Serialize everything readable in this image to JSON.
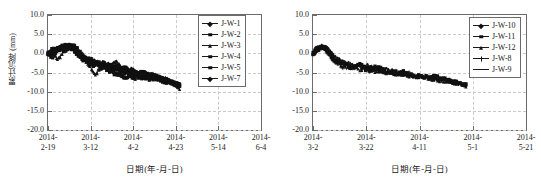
{
  "figure": {
    "panels": [
      {
        "id": "left-chart",
        "ylabel": "累计沉降 (mm)",
        "xlabel": "日期(年-月-日)",
        "yticks": [
          "10.0",
          "5.0",
          "0.0",
          "-5.0",
          "-10.0",
          "-15.0",
          "-20.0"
        ],
        "xticks": [
          {
            "top": "2014-",
            "bottom": "2-19"
          },
          {
            "top": "2014-",
            "bottom": "3-12"
          },
          {
            "top": "2014-",
            "bottom": "4-2"
          },
          {
            "top": "2014-",
            "bottom": "4-23"
          },
          {
            "top": "2014-",
            "bottom": "5-14"
          },
          {
            "top": "2014-",
            "bottom": "6-4"
          }
        ],
        "legend": [
          {
            "label": "J-W-1",
            "marker": "diamond"
          },
          {
            "label": "J-W-2",
            "marker": "square"
          },
          {
            "label": "J-W-3",
            "marker": "triangle"
          },
          {
            "label": "J-W-4",
            "marker": "square"
          },
          {
            "label": "J-W-5",
            "marker": "square"
          },
          {
            "label": "J-W-7",
            "marker": "diamond"
          }
        ]
      },
      {
        "id": "right-chart",
        "ylabel": "累计沉降 (mm)",
        "xlabel": "日期(年-月-日)",
        "yticks": [
          "10.0",
          "5.0",
          "0.0",
          "-5.0",
          "-10.0",
          "-15.0",
          "-20.0"
        ],
        "xticks": [
          {
            "top": "2014-",
            "bottom": "3-2"
          },
          {
            "top": "2014-",
            "bottom": "3-22"
          },
          {
            "top": "2014-",
            "bottom": "4-11"
          },
          {
            "top": "2014-",
            "bottom": "5-1"
          },
          {
            "top": "2014-",
            "bottom": "5-21"
          }
        ],
        "legend": [
          {
            "label": "J-W-10",
            "marker": "diamond"
          },
          {
            "label": "J-W-11",
            "marker": "square"
          },
          {
            "label": "J-W-12",
            "marker": "triangle"
          },
          {
            "label": "J-W-8",
            "marker": "plus"
          },
          {
            "label": "J-W-9",
            "marker": "none"
          }
        ]
      }
    ]
  },
  "chart_data": [
    {
      "type": "line",
      "id": "left-chart",
      "title": "",
      "xlabel": "日期(年-月-日)",
      "ylabel": "累计沉降 (mm)",
      "ylim": [
        -20.0,
        10.0
      ],
      "ytick_values": [
        10.0,
        5.0,
        0.0,
        -5.0,
        -10.0,
        -15.0,
        -20.0
      ],
      "xtick_labels": [
        "2014-2-19",
        "2014-3-12",
        "2014-4-2",
        "2014-4-23",
        "2014-5-14",
        "2014-6-4"
      ],
      "x_unit": "date",
      "grid": true,
      "legend_position": "top-right",
      "x_data_fraction_range": [
        0.0,
        0.62
      ],
      "series": [
        {
          "name": "J-W-1",
          "marker": "diamond",
          "x": [
            0.0,
            0.02,
            0.04,
            0.06,
            0.08,
            0.1,
            0.12,
            0.14,
            0.16,
            0.18,
            0.2,
            0.22,
            0.24,
            0.26,
            0.28,
            0.3,
            0.32,
            0.34,
            0.36,
            0.38,
            0.4,
            0.42,
            0.44,
            0.46,
            0.48,
            0.5,
            0.52,
            0.54,
            0.56,
            0.58,
            0.6,
            0.62
          ],
          "y": [
            0.0,
            0.6,
            1.4,
            1.0,
            1.9,
            2.2,
            1.6,
            0.4,
            -0.6,
            -1.2,
            -1.9,
            -2.1,
            -2.6,
            -2.2,
            -2.9,
            -3.4,
            -3.1,
            -3.8,
            -4.1,
            -4.4,
            -4.2,
            -4.8,
            -5.1,
            -5.0,
            -5.4,
            -5.8,
            -6.2,
            -6.5,
            -6.9,
            -7.4,
            -7.8,
            -8.2
          ]
        },
        {
          "name": "J-W-2",
          "marker": "square",
          "x": [
            0.0,
            0.02,
            0.04,
            0.06,
            0.08,
            0.1,
            0.12,
            0.14,
            0.16,
            0.18,
            0.2,
            0.22,
            0.24,
            0.26,
            0.28,
            0.3,
            0.32,
            0.34,
            0.36,
            0.38,
            0.4,
            0.42,
            0.44,
            0.46,
            0.48,
            0.5,
            0.52,
            0.54,
            0.56,
            0.58,
            0.6,
            0.62
          ],
          "y": [
            0.0,
            -0.4,
            0.8,
            1.5,
            0.9,
            1.8,
            1.2,
            0.1,
            -1.1,
            -1.6,
            -1.4,
            -2.4,
            -3.0,
            -3.6,
            -2.8,
            -3.2,
            -3.9,
            -4.3,
            -3.8,
            -4.6,
            -4.9,
            -5.2,
            -4.8,
            -5.5,
            -5.9,
            -6.1,
            -6.4,
            -6.8,
            -7.1,
            -7.6,
            -8.0,
            -8.4
          ]
        },
        {
          "name": "J-W-3",
          "marker": "triangle",
          "x": [
            0.0,
            0.02,
            0.04,
            0.06,
            0.08,
            0.1,
            0.12,
            0.14,
            0.16,
            0.18,
            0.2,
            0.22,
            0.24,
            0.26,
            0.28,
            0.3,
            0.32,
            0.34,
            0.36,
            0.38,
            0.4,
            0.42,
            0.44,
            0.46,
            0.48,
            0.5,
            0.52,
            0.54,
            0.56,
            0.58,
            0.6,
            0.62
          ],
          "y": [
            0.0,
            0.3,
            -1.4,
            -0.8,
            1.2,
            2.0,
            1.4,
            0.6,
            -0.9,
            -2.2,
            -3.4,
            -5.9,
            -4.1,
            -3.3,
            -2.6,
            -3.0,
            -1.9,
            -3.5,
            -4.0,
            -4.5,
            -4.3,
            -5.0,
            -5.3,
            -5.6,
            -5.2,
            -5.7,
            -6.0,
            -6.6,
            -7.0,
            -7.3,
            -7.9,
            -9.5
          ]
        },
        {
          "name": "J-W-4",
          "marker": "square",
          "x": [
            0.0,
            0.02,
            0.04,
            0.06,
            0.08,
            0.1,
            0.12,
            0.14,
            0.16,
            0.18,
            0.2,
            0.22,
            0.24,
            0.26,
            0.28,
            0.3,
            0.32,
            0.34,
            0.36,
            0.38,
            0.4,
            0.42,
            0.44,
            0.46,
            0.48,
            0.5,
            0.52,
            0.54,
            0.56,
            0.58,
            0.6,
            0.62
          ],
          "y": [
            0.0,
            0.9,
            1.1,
            1.7,
            2.1,
            1.5,
            0.8,
            -0.3,
            -1.5,
            -2.0,
            -2.8,
            -3.2,
            -2.4,
            -3.7,
            -4.2,
            -4.9,
            -5.4,
            -6.0,
            -6.3,
            -6.1,
            -6.5,
            -6.2,
            -6.6,
            -6.4,
            -6.8,
            -6.5,
            -6.9,
            -7.2,
            -7.5,
            -7.8,
            -8.1,
            -8.3
          ]
        },
        {
          "name": "J-W-5",
          "marker": "square",
          "x": [
            0.0,
            0.02,
            0.04,
            0.06,
            0.08,
            0.1,
            0.12,
            0.14,
            0.16,
            0.18,
            0.2,
            0.22,
            0.24,
            0.26,
            0.28,
            0.3,
            0.32,
            0.34,
            0.36,
            0.38,
            0.4,
            0.42,
            0.44,
            0.46,
            0.48,
            0.5,
            0.52,
            0.54,
            0.56,
            0.58,
            0.6,
            0.62
          ],
          "y": [
            0.0,
            -1.0,
            0.5,
            1.3,
            0.7,
            1.6,
            2.3,
            0.9,
            -0.5,
            -1.8,
            -2.5,
            -2.1,
            -3.3,
            -2.7,
            -3.6,
            -4.4,
            -4.0,
            -4.7,
            -5.2,
            -4.9,
            -5.5,
            -5.3,
            -5.8,
            -6.0,
            -5.6,
            -6.3,
            -6.7,
            -7.0,
            -7.4,
            -7.7,
            -8.2,
            -8.6
          ]
        },
        {
          "name": "J-W-7",
          "marker": "diamond",
          "x": [
            0.0,
            0.02,
            0.04,
            0.06,
            0.08,
            0.1,
            0.12,
            0.14,
            0.16,
            0.18,
            0.2,
            0.22,
            0.24,
            0.26,
            0.28,
            0.3,
            0.32,
            0.34,
            0.36,
            0.38,
            0.4,
            0.42,
            0.44,
            0.46,
            0.48,
            0.5,
            0.52,
            0.54,
            0.56,
            0.58,
            0.6,
            0.62
          ],
          "y": [
            0.0,
            0.2,
            1.0,
            1.8,
            1.4,
            2.4,
            1.1,
            0.0,
            -1.3,
            -1.0,
            -2.2,
            -2.9,
            -3.5,
            -4.0,
            -3.1,
            -3.8,
            -4.5,
            -4.2,
            -4.8,
            -5.1,
            -5.4,
            -5.0,
            -5.7,
            -5.9,
            -6.2,
            -6.0,
            -6.4,
            -6.8,
            -7.2,
            -7.5,
            -7.9,
            -8.1
          ]
        }
      ]
    },
    {
      "type": "line",
      "id": "right-chart",
      "title": "",
      "xlabel": "日期(年-月-日)",
      "ylabel": "累计沉降 (mm)",
      "ylim": [
        -20.0,
        10.0
      ],
      "ytick_values": [
        10.0,
        5.0,
        0.0,
        -5.0,
        -10.0,
        -15.0,
        -20.0
      ],
      "xtick_labels": [
        "2014-3-2",
        "2014-3-22",
        "2014-4-11",
        "2014-5-1",
        "2014-5-21"
      ],
      "x_unit": "date",
      "grid": true,
      "legend_position": "top-right",
      "x_data_fraction_range": [
        0.0,
        0.72
      ],
      "series": [
        {
          "name": "J-W-10",
          "marker": "diamond",
          "x": [
            0.0,
            0.02,
            0.04,
            0.06,
            0.08,
            0.1,
            0.14,
            0.18,
            0.22,
            0.26,
            0.3,
            0.34,
            0.38,
            0.42,
            0.46,
            0.5,
            0.54,
            0.58,
            0.62,
            0.66,
            0.7,
            0.72
          ],
          "y": [
            0.0,
            1.2,
            1.9,
            1.5,
            0.6,
            -0.8,
            -2.1,
            -3.0,
            -3.8,
            -3.2,
            -4.3,
            -4.0,
            -4.8,
            -5.3,
            -5.9,
            -6.2,
            -6.0,
            -6.6,
            -7.1,
            -7.6,
            -8.1,
            -8.3
          ]
        },
        {
          "name": "J-W-11",
          "marker": "square",
          "x": [
            0.0,
            0.02,
            0.04,
            0.06,
            0.08,
            0.1,
            0.14,
            0.18,
            0.22,
            0.26,
            0.3,
            0.34,
            0.38,
            0.42,
            0.46,
            0.5,
            0.54,
            0.58,
            0.62,
            0.66,
            0.7,
            0.72
          ],
          "y": [
            0.0,
            0.8,
            1.6,
            1.1,
            0.2,
            -1.4,
            -2.6,
            -3.5,
            -2.9,
            -4.0,
            -3.4,
            -4.6,
            -5.1,
            -4.7,
            -5.5,
            -5.8,
            -6.3,
            -6.1,
            -6.8,
            -7.3,
            -7.9,
            -8.2
          ]
        },
        {
          "name": "J-W-12",
          "marker": "triangle",
          "x": [
            0.0,
            0.02,
            0.04,
            0.06,
            0.08,
            0.1,
            0.14,
            0.18,
            0.22,
            0.26,
            0.3,
            0.34,
            0.38,
            0.42,
            0.46,
            0.5,
            0.54,
            0.58,
            0.62,
            0.66,
            0.7,
            0.72
          ],
          "y": [
            0.0,
            1.5,
            2.0,
            1.3,
            -0.4,
            -1.9,
            -3.3,
            -2.7,
            -4.2,
            -3.6,
            -4.9,
            -5.2,
            -4.4,
            -5.6,
            -6.0,
            -5.7,
            -6.4,
            -6.9,
            -7.2,
            -7.7,
            -8.0,
            -8.4
          ]
        },
        {
          "name": "J-W-8",
          "marker": "plus",
          "x": [
            0.0,
            0.02,
            0.04,
            0.06,
            0.08,
            0.1,
            0.14,
            0.18,
            0.22,
            0.26,
            0.3,
            0.34,
            0.38,
            0.42,
            0.46,
            0.5,
            0.54,
            0.58,
            0.62,
            0.66,
            0.7,
            0.72
          ],
          "y": [
            0.0,
            1.0,
            1.7,
            0.9,
            -0.9,
            -2.3,
            -3.6,
            -4.1,
            -3.1,
            -4.5,
            -4.1,
            -5.0,
            -4.6,
            -5.4,
            -5.2,
            -6.1,
            -5.9,
            -6.5,
            -7.0,
            -7.4,
            -8.2,
            -8.5
          ]
        },
        {
          "name": "J-W-9",
          "marker": "none",
          "x": [
            0.0,
            0.02,
            0.04,
            0.06,
            0.08,
            0.1,
            0.14,
            0.18,
            0.22,
            0.26,
            0.3,
            0.34,
            0.38,
            0.42,
            0.46,
            0.5,
            0.54,
            0.58,
            0.62,
            0.66,
            0.7,
            0.72
          ],
          "y": [
            0.0,
            1.3,
            1.8,
            1.4,
            0.0,
            -1.6,
            -2.9,
            -3.7,
            -3.4,
            -4.4,
            -3.9,
            -4.7,
            -5.3,
            -5.0,
            -5.8,
            -6.0,
            -6.2,
            -6.7,
            -7.0,
            -7.5,
            -8.0,
            -8.3
          ]
        }
      ]
    }
  ]
}
